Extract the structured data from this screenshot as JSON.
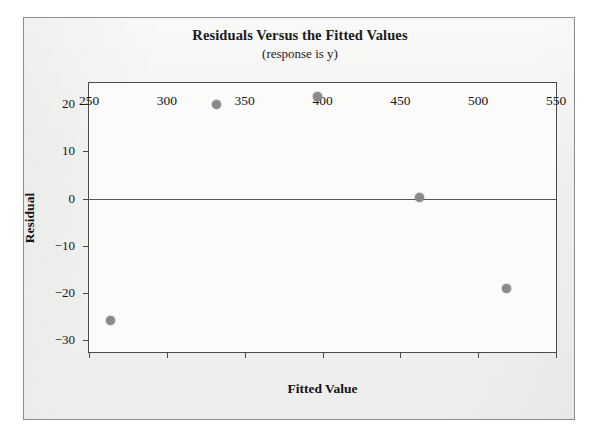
{
  "figure": {
    "title": "Residuals Versus the Fitted Values",
    "subtitle": "(response is y)",
    "x_axis_title": "Fitted Value",
    "y_axis_title": "Residual",
    "frame_color": "#8d8d8d",
    "axis_color": "#4a4a4a",
    "marker_color": "#8a8a8a",
    "background_color": "#f2f2f0"
  },
  "chart_data": {
    "type": "scatter",
    "title": "Residuals Versus the Fitted Values",
    "subtitle": "(response is y)",
    "xlabel": "Fitted Value",
    "ylabel": "Residual",
    "xlim": [
      250,
      550
    ],
    "ylim": [
      -32.5,
      24.5
    ],
    "xticks": [
      250,
      300,
      350,
      400,
      450,
      500,
      550
    ],
    "xtick_labels": [
      "250",
      "300",
      "350",
      "400",
      "450",
      "500",
      "550"
    ],
    "yticks": [
      20,
      10,
      0,
      -10,
      -20,
      -30
    ],
    "ytick_labels": [
      "20",
      "10",
      "0",
      "−10",
      "−20",
      "−30"
    ],
    "grid": false,
    "legend": null,
    "reference_line": {
      "orientation": "horizontal",
      "y": 0
    },
    "points": [
      {
        "x": 264,
        "y": -25.8
      },
      {
        "x": 332,
        "y": 20.0
      },
      {
        "x": 397,
        "y": 21.7
      },
      {
        "x": 462,
        "y": 0.3
      },
      {
        "x": 518,
        "y": -19.0
      }
    ],
    "x": [
      264,
      332,
      397,
      462,
      518
    ],
    "y": [
      -25.8,
      20.0,
      21.7,
      0.3,
      -19.0
    ]
  }
}
